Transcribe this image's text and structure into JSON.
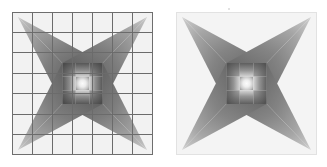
{
  "figure": {
    "background_color": "#ffffff",
    "panel_count": 2,
    "panel_width_px": 141,
    "panel_height_px": 143,
    "panel_gap_px": 23
  },
  "panels": [
    {
      "id": "left",
      "name": "gridded-star-panel",
      "label": "Gridded star panel",
      "has_grid": true,
      "grid_rows": 7,
      "grid_cols": 7,
      "grid_line_color": "#6b6b6b",
      "grid_line_width_px": 1,
      "border_color": "#6e6e6e",
      "field_color": "#f2f2f2",
      "x_px": 12,
      "y_px": 12
    },
    {
      "id": "right",
      "name": "ungridded-star-panel",
      "label": "Ungridded star panel",
      "has_grid": false,
      "grid_rows": 0,
      "grid_cols": 0,
      "grid_line_color": "",
      "grid_line_width_px": 0,
      "border_color": "#e2e2e2",
      "field_color": "#f4f4f4",
      "x_px": 176,
      "y_px": 12
    }
  ],
  "star": {
    "name": "four-pointed-concave-star",
    "points": 4,
    "orientation": "diagonal",
    "tip_corners": [
      "top-left",
      "top-right",
      "bottom-right",
      "bottom-left"
    ],
    "waist_fraction": 0.285,
    "center_block_cells": 9,
    "center_block_grid": "3x3",
    "arm_fill_dark": "#6f6f6f",
    "arm_fill_light": "#b8b8b8",
    "center_highlight": "#f0f0f0",
    "center_shadow": "#4a4a4a"
  },
  "center_block": {
    "description": "3x3 arrangement of gradient cells at the star waist",
    "cells": [
      {
        "row": 0,
        "col": 0,
        "type": "corner-dark",
        "value": "#5a5a5a"
      },
      {
        "row": 0,
        "col": 1,
        "type": "edge-radial",
        "value": "#8a8a8a"
      },
      {
        "row": 0,
        "col": 2,
        "type": "corner-dark",
        "value": "#5a5a5a"
      },
      {
        "row": 1,
        "col": 0,
        "type": "edge-radial",
        "value": "#8a8a8a"
      },
      {
        "row": 1,
        "col": 1,
        "type": "center-bright",
        "value": "#efefef"
      },
      {
        "row": 1,
        "col": 2,
        "type": "edge-radial",
        "value": "#8a8a8a"
      },
      {
        "row": 2,
        "col": 0,
        "type": "corner-dark",
        "value": "#5a5a5a"
      },
      {
        "row": 2,
        "col": 1,
        "type": "edge-radial",
        "value": "#8a8a8a"
      },
      {
        "row": 2,
        "col": 2,
        "type": "corner-dark",
        "value": "#5a5a5a"
      }
    ]
  },
  "annotations": {
    "speck_visible": true,
    "speck_x_px": 228,
    "speck_y_px": 8
  }
}
